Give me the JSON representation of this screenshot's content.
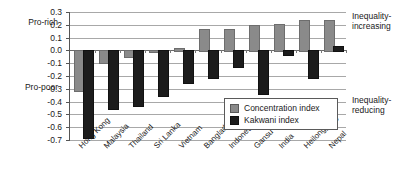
{
  "annotations": {
    "pro_rich": "Pro-rich",
    "pro_poor": "Pro-poor",
    "inequality_increasing": "Inequality-\nincreasing",
    "inequality_reducing": "Inequality-\nreducing"
  },
  "legend": {
    "items": [
      {
        "label": "Concentration index",
        "color": "#8a8a8a",
        "key": "concentration"
      },
      {
        "label": "Kakwani index",
        "color": "#1c1c1c",
        "key": "kakwani"
      }
    ]
  },
  "chart_data": {
    "type": "bar",
    "title": "",
    "xlabel": "",
    "ylabel": "",
    "ylim": [
      -0.7,
      0.3
    ],
    "ytick_step": 0.1,
    "yticks": [
      0.3,
      0.2,
      0.1,
      0.0,
      -0.1,
      -0.2,
      -0.3,
      -0.4,
      -0.5,
      -0.6,
      -0.7
    ],
    "ytick_labels": [
      "0.3",
      "0.2",
      "0.1",
      "0.0",
      "-0.1",
      "-0.2",
      "-0.3",
      "-0.4",
      "-0.5",
      "-0.6",
      "-0.7"
    ],
    "grid": true,
    "legend_position": "inside-bottom-right",
    "categories": [
      "Hong Kong",
      "Malaysia",
      "Thailand",
      "Sri Lanka",
      "Vietnam",
      "Bangladesh",
      "Indonesia",
      "Gansu",
      "India",
      "Heilongjiang",
      "Nepal"
    ],
    "series": [
      {
        "name": "Concentration index",
        "color": "#8a8a8a",
        "values": [
          -0.31,
          -0.09,
          -0.04,
          -0.005,
          0.015,
          0.17,
          0.17,
          0.2,
          0.21,
          0.24,
          0.24
        ]
      },
      {
        "name": "Kakwani index",
        "color": "#1c1c1c",
        "values": [
          -0.68,
          -0.45,
          -0.43,
          -0.35,
          -0.25,
          -0.21,
          -0.12,
          -0.33,
          -0.03,
          -0.21,
          0.035
        ]
      }
    ]
  }
}
